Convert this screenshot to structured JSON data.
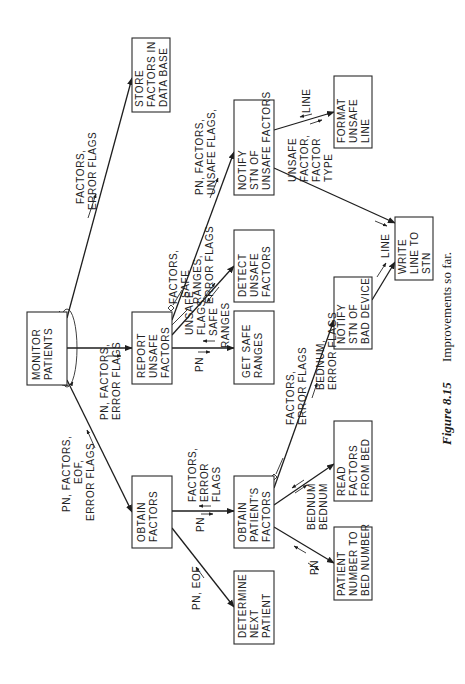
{
  "figure": {
    "number": "Figure 8.15",
    "caption": "Improvements so far."
  },
  "modules": {
    "monitor_patients": [
      "MONITOR",
      "PATIENTS"
    ],
    "store_factors": [
      "STORE",
      "FACTORS IN",
      "DATA BASE"
    ],
    "report_unsafe": [
      "REPORT",
      "UNSAFE",
      "FACTORS"
    ],
    "obtain_factors": [
      "OBTAIN",
      "FACTORS"
    ],
    "notify_unsafe": [
      "NOTIFY",
      "STN OF",
      "UNSAFE FACTORS"
    ],
    "detect_unsafe": [
      "DETECT",
      "UNSAFE",
      "FACTORS"
    ],
    "get_safe_ranges": [
      "GET SAFE",
      "RANGES"
    ],
    "obtain_patients": [
      "OBTAIN",
      "PATIENT'S",
      "FACTORS"
    ],
    "determine_next": [
      "DETERMINE",
      "NEXT",
      "PATIENT"
    ],
    "format_unsafe": [
      "FORMAT",
      "UNSAFE",
      "LINE"
    ],
    "write_line": [
      "WRITE",
      "LINE TO",
      "STN"
    ],
    "notify_bad": [
      "NOTIFY",
      "STN OF",
      "BAD DEVICE"
    ],
    "read_factors": [
      "READ",
      "FACTORS",
      "FROM BED"
    ],
    "pn_to_bed": [
      "PATIENT",
      "NUMBER TO",
      "BED NUMBER"
    ]
  },
  "flows": {
    "mp_store": [
      "FACTORS,",
      "ERROR FLAGS"
    ],
    "mp_report": [
      "PN, FACTORS,",
      "ERROR FLAGS"
    ],
    "mp_obtain": [
      "PN, FACTORS,",
      "EOF,",
      "ERROR FLAGS"
    ],
    "rep_notify": [
      "PN, FACTORS,",
      "UNSAFE FLAGS,"
    ],
    "rep_detect_in": [
      "FACTORS,",
      "SAFE",
      "RANGES,",
      "ERROR FLAGS"
    ],
    "rep_detect_out": [
      "UNSAFE",
      "FLAGS"
    ],
    "rep_get_in": "PN",
    "rep_get_out": [
      "SAFE",
      "RANGES"
    ],
    "of_opf_in": "PN",
    "of_opf_out": [
      "FACTORS,",
      "ERROR",
      "FLAGS"
    ],
    "of_det": "PN, EOF",
    "notify_format_in": [
      "UNSAFE",
      "FACTOR,",
      "FACTOR",
      "TYPE"
    ],
    "notify_format_out": "LINE",
    "bad_write": "LINE",
    "opf_bad": [
      "FACTORS,",
      "ERROR FLAGS"
    ],
    "opf_read_in": [
      "BEDNUM,",
      "ERROR FLAGS"
    ],
    "opf_read": "BEDNUM",
    "opf_pn_out": "BEDNUM",
    "opf_pn_in": "PN"
  }
}
